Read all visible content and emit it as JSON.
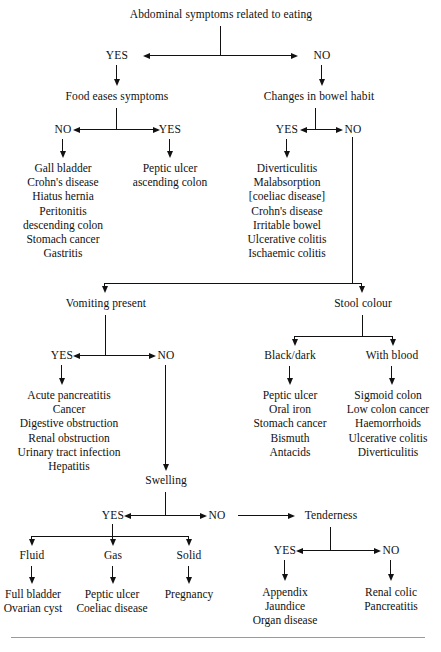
{
  "title": "Abdominal symptoms related to eating",
  "branches": {
    "yes": "YES",
    "no": "NO"
  },
  "nodes": {
    "root": "Abdominal symptoms related to eating",
    "food_eases": "Food eases symptoms",
    "bowel_habit": "Changes in bowel habit",
    "vomiting": "Vomiting present",
    "stool_colour": "Stool colour",
    "black_dark": "Black/dark",
    "with_blood": "With blood",
    "swelling": "Swelling",
    "tenderness": "Tenderness",
    "fluid": "Fluid",
    "gas": "Gas",
    "solid": "Solid"
  },
  "labels": {
    "root_yes": "YES",
    "root_no": "NO",
    "food_no": "NO",
    "food_yes": "YES",
    "bowel_yes": "YES",
    "bowel_no": "NO",
    "vomit_yes": "YES",
    "vomit_no": "NO",
    "swell_yes": "YES",
    "swell_no": "NO",
    "tender_yes": "YES",
    "tender_no": "NO"
  },
  "lists": {
    "food_no_list": [
      "Gall bladder",
      "Crohn's disease",
      "Hiatus hernia",
      "Peritonitis",
      "descending colon",
      "Stomach cancer",
      "Gastritis"
    ],
    "food_yes_list": [
      "Peptic ulcer",
      "ascending colon"
    ],
    "bowel_yes_list": [
      "Diverticulitis",
      "Malabsorption",
      "[coeliac disease]",
      "Crohn's disease",
      "Irritable bowel",
      "Ulcerative colitis",
      "Ischaemic colitis"
    ],
    "vomit_yes_list": [
      "Acute pancreatitis",
      "Cancer",
      "Digestive obstruction",
      "Renal obstruction",
      "Urinary tract infection",
      "Hepatitis"
    ],
    "black_dark_list": [
      "Peptic ulcer",
      "Oral iron",
      "Stomach cancer",
      "Bismuth",
      "Antacids"
    ],
    "with_blood_list": [
      "Sigmoid colon",
      "Low colon cancer",
      "Haemorrhoids",
      "Ulcerative colitis",
      "Diverticulitis"
    ],
    "fluid_list": [
      "Full bladder",
      "Ovarian cyst"
    ],
    "gas_list": [
      "Peptic ulcer",
      "Coeliac disease"
    ],
    "solid_list": [
      "Pregnancy"
    ],
    "tender_yes_list": [
      "Appendix",
      "Jaundice",
      "Organ disease"
    ],
    "tender_no_list": [
      "Renal colic",
      "Pancreatitis"
    ]
  },
  "colors": {
    "line": "#111111",
    "text": "#111111",
    "rule": "#9a9a9a",
    "background": "#ffffff"
  }
}
